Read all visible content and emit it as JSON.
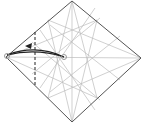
{
  "diagram": {
    "type": "origami-step",
    "title": "",
    "colors": {
      "outline": "#555555",
      "crease": "#bbbbbb",
      "fold_line": "#222222",
      "arrow": "#222222",
      "marker": "#999999"
    },
    "square": {
      "top": [
        72,
        1
      ],
      "right": [
        141,
        58
      ],
      "bottom": [
        72,
        122
      ],
      "left": [
        6,
        57
      ]
    },
    "creases": [
      [
        72,
        1,
        72,
        122
      ],
      [
        6,
        57,
        141,
        58
      ],
      [
        48,
        20,
        72,
        122
      ],
      [
        72,
        1,
        48,
        98
      ],
      [
        72,
        1,
        97,
        98
      ],
      [
        97,
        20,
        72,
        122
      ],
      [
        48,
        20,
        141,
        58
      ],
      [
        48,
        98,
        141,
        58
      ],
      [
        6,
        57,
        97,
        20
      ],
      [
        6,
        57,
        97,
        98
      ],
      [
        50,
        25,
        120,
        80
      ],
      [
        50,
        92,
        120,
        36
      ],
      [
        40,
        30,
        95,
        110
      ],
      [
        40,
        88,
        95,
        8
      ],
      [
        32,
        42,
        100,
        100
      ],
      [
        32,
        74,
        100,
        18
      ]
    ],
    "fold_line": {
      "x": 35,
      "y1": 32,
      "y2": 85,
      "style": "dashed"
    },
    "arrow": {
      "from": [
        64,
        57
      ],
      "to": [
        7,
        55
      ],
      "label": "valley fold left point to reference point"
    },
    "markers": [
      [
        7,
        56
      ],
      [
        64,
        57
      ]
    ]
  }
}
